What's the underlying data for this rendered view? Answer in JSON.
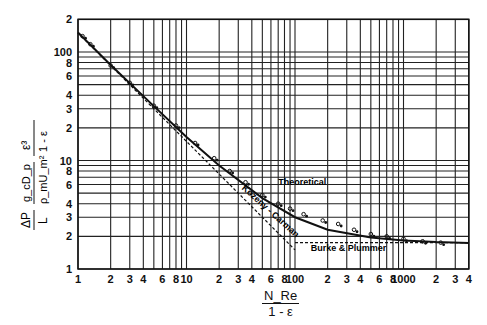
{
  "chart_data": {
    "type": "line",
    "title": "",
    "xlabel": "N_Re / (1 - ε)",
    "ylabel": "(ΔP / L)(g_c D_p / ρ_m U_m²)(ε³ / (1 - ε))",
    "x_scale": "log",
    "y_scale": "log",
    "xlim": [
      1,
      4000
    ],
    "ylim": [
      1,
      200
    ],
    "grid": true,
    "x_ticks": [
      "1",
      "2",
      "3",
      "4",
      "6",
      "8",
      "10",
      "2",
      "3",
      "4",
      "6",
      "8",
      "100",
      "2",
      "3",
      "4",
      "6",
      "8",
      "1000",
      "2",
      "3",
      "4"
    ],
    "y_ticks": [
      "1",
      "2",
      "3",
      "4",
      "6",
      "8",
      "10",
      "2",
      "3",
      "4",
      "6",
      "8",
      "100",
      "2"
    ],
    "series": [
      {
        "name": "Theoretical",
        "style": "solid",
        "x": [
          1,
          2,
          5,
          10,
          20,
          50,
          100,
          200,
          500,
          1000,
          2000,
          4000
        ],
        "y": [
          151,
          76,
          31.7,
          16.5,
          9.0,
          4.5,
          3.0,
          2.3,
          1.95,
          1.83,
          1.77,
          1.74
        ]
      },
      {
        "name": "Kozeny - Carman",
        "style": "dashed",
        "x": [
          1,
          10,
          100
        ],
        "y": [
          150,
          15,
          1.5
        ]
      },
      {
        "name": "Burke & Plummer",
        "style": "dashed",
        "x": [
          100,
          4000
        ],
        "y": [
          1.75,
          1.75
        ]
      },
      {
        "name": "Experimental data",
        "style": "markers",
        "x": [
          1.1,
          1.3,
          2,
          3,
          5,
          8,
          12,
          18,
          25,
          35,
          50,
          70,
          90,
          120,
          180,
          250,
          350,
          500,
          700,
          1000,
          1500,
          2200
        ],
        "y": [
          140,
          118,
          75,
          52,
          32,
          21,
          14.5,
          10.5,
          8,
          6.3,
          4.8,
          4.0,
          3.6,
          3.2,
          2.8,
          2.6,
          2.3,
          2.1,
          2.0,
          1.9,
          1.8,
          1.75
        ]
      }
    ],
    "annotations": [
      "Theoretical",
      "Kozeny - Carman",
      "Burke & Plummer"
    ]
  },
  "labels": {
    "y_num1": "ΔP",
    "y_den1": "L",
    "y_num2": "g_cD_p",
    "y_den2": "ρ_mU_m²",
    "y_num3": "ε³",
    "y_den3": "1 - ε",
    "x_num": "N_Re",
    "x_den": "1 - ε",
    "theoretical": "Theoretical",
    "kozeny": "Kozeny - Carman",
    "burke": "Burke & Plummer"
  }
}
